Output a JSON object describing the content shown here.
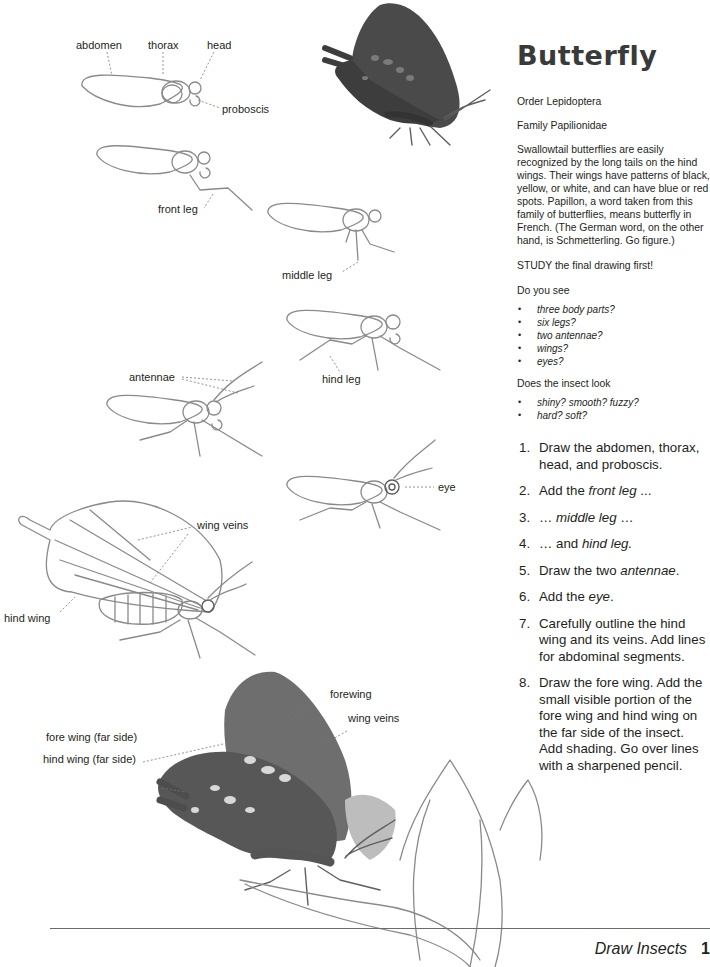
{
  "header": {
    "title": "Butterfly",
    "order": "Order Lepidoptera",
    "family": "Family Papilionidae"
  },
  "description": "Swallowtail butterflies are easily recognized by the long tails on the hind wings. Their wings have patterns of black, yellow, or white, and can have blue or red spots. Papillon, a word taken from this family of butterflies, means butterfly in French. (The German word, on the other hand, is Schmetterling. Go figure.)",
  "study_note": "STUDY the final drawing first!",
  "do_you_see": {
    "heading": "Do you see",
    "items": [
      "three body parts?",
      "six legs?",
      "two antennae?",
      "wings?",
      "eyes?"
    ]
  },
  "does_it_look": {
    "heading": "Does the insect look",
    "items": [
      "shiny? smooth? fuzzy?",
      "hard? soft?"
    ]
  },
  "bullet_glyph": "•",
  "steps": [
    {
      "num": "1.",
      "pre": "Draw the abdomen, thorax, head, and proboscis.",
      "em": "",
      "post": ""
    },
    {
      "num": "2.",
      "pre": "Add the ",
      "em": "front leg",
      "post": " ..."
    },
    {
      "num": "3.",
      "pre": "… ",
      "em": "middle leg",
      "post": " …"
    },
    {
      "num": "4.",
      "pre": "… and ",
      "em": "hind leg.",
      "post": ""
    },
    {
      "num": "5.",
      "pre": "Draw the two ",
      "em": "antennae",
      "post": "."
    },
    {
      "num": "6.",
      "pre": "Add the ",
      "em": "eye",
      "post": "."
    },
    {
      "num": "7.",
      "pre": "Carefully outline the hind wing and its veins. Add lines for abdominal segments.",
      "em": "",
      "post": ""
    },
    {
      "num": "8.",
      "pre": "Draw the fore wing. Add the small visible portion of the fore wing and hind wing on the far side of the insect. Add shading. Go over lines with a sharpened pencil.",
      "em": "",
      "post": ""
    }
  ],
  "diagram_labels": {
    "abdomen": "abdomen",
    "thorax": "thorax",
    "head": "head",
    "proboscis": "proboscis",
    "front_leg": "front leg",
    "middle_leg": "middle leg",
    "hind_leg": "hind leg",
    "antennae": "antennae",
    "eye": "eye",
    "wing_veins_1": "wing veins",
    "hind_wing": "hind wing",
    "forewing": "forewing",
    "wing_veins_2": "wing veins",
    "fore_wing_far": "fore wing (far side)",
    "hind_wing_far": "hind wing (far side)"
  },
  "footer": {
    "section": "Draw Insects",
    "page_number": "1"
  }
}
